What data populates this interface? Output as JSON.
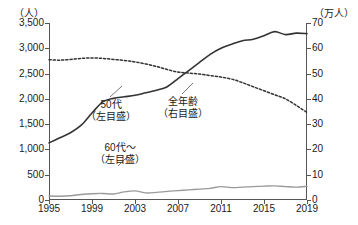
{
  "header": {
    "cutoff_text": "",
    "left_axis_unit": "（人）",
    "right_axis_unit": "（万人）"
  },
  "annotations": {
    "fifties": {
      "name": "50代",
      "scale": "（左目盛）"
    },
    "allages": {
      "name": "全年齢",
      "scale": "（右目盛）"
    },
    "sixties": {
      "name": "60代〜",
      "scale": "（左目盛）"
    }
  },
  "chart_data": {
    "type": "line",
    "title": "",
    "xlabel": "",
    "ylabel": "（人）",
    "y2label": "（万人）",
    "grid": false,
    "legend": "annotations-inline",
    "xlim": [
      1995,
      2019
    ],
    "ylim": [
      0,
      3500
    ],
    "y2lim": [
      0,
      70
    ],
    "yticks": [
      "0",
      "500",
      "1,000",
      "1,500",
      "2,000",
      "2,500",
      "3,000",
      "3,500"
    ],
    "ytick_values": [
      0,
      500,
      1000,
      1500,
      2000,
      2500,
      3000,
      3500
    ],
    "y2ticks": [
      "0",
      "10",
      "20",
      "30",
      "40",
      "50",
      "60",
      "70"
    ],
    "y2tick_values": [
      0,
      10,
      20,
      30,
      40,
      50,
      60,
      70
    ],
    "xticks": [
      "1995",
      "1999",
      "2003",
      "2007",
      "2011",
      "2015",
      "2019"
    ],
    "xtick_values": [
      1995,
      1999,
      2003,
      2007,
      2011,
      2015,
      2019
    ],
    "x": [
      1995,
      1996,
      1997,
      1998,
      1999,
      2000,
      2001,
      2002,
      2003,
      2004,
      2005,
      2006,
      2007,
      2008,
      2009,
      2010,
      2011,
      2012,
      2013,
      2014,
      2015,
      2016,
      2017,
      2018,
      2019
    ],
    "series": [
      {
        "name": "50代（左目盛）",
        "axis": "left",
        "style": "solid",
        "color": "#333333",
        "width": 1.6,
        "values": [
          1130,
          1230,
          1330,
          1480,
          1720,
          1940,
          2010,
          2040,
          2070,
          2120,
          2170,
          2240,
          2400,
          2560,
          2720,
          2880,
          3000,
          3080,
          3150,
          3180,
          3250,
          3330,
          3270,
          3300,
          3290
        ]
      },
      {
        "name": "60代〜（左目盛）",
        "axis": "left",
        "style": "solid",
        "color": "#9a9a9a",
        "width": 1.4,
        "values": [
          80,
          75,
          85,
          110,
          125,
          130,
          120,
          160,
          180,
          140,
          150,
          170,
          185,
          200,
          215,
          230,
          265,
          245,
          255,
          265,
          275,
          280,
          265,
          255,
          270
        ]
      },
      {
        "name": "全年齢（右目盛）",
        "axis": "right",
        "style": "dotted",
        "color": "#333333",
        "width": 1.5,
        "values": [
          55.5,
          55.3,
          55.6,
          56.0,
          56.2,
          56.0,
          55.6,
          55.2,
          54.6,
          53.8,
          52.8,
          51.6,
          50.6,
          50.2,
          49.8,
          49.2,
          48.6,
          47.8,
          46.4,
          44.8,
          43.2,
          41.6,
          40.0,
          37.4,
          34.6
        ]
      }
    ]
  }
}
